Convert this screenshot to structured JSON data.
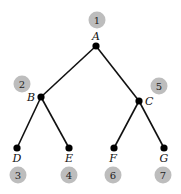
{
  "diagram": {
    "type": "binary-tree-traversal-order",
    "colors": {
      "edge": "#111111",
      "node": "#000000",
      "order_badge": "#bdbdbd",
      "order_text": "#222222"
    },
    "nodes": [
      {
        "id": "A",
        "label": "A",
        "x": 96,
        "y": 46,
        "label_x": 96,
        "label_y": 40,
        "label_anchor": "middle",
        "order": "1",
        "order_x": 97,
        "order_y": 20
      },
      {
        "id": "B",
        "label": "B",
        "x": 41,
        "y": 97,
        "label_x": 35,
        "label_y": 101,
        "label_anchor": "end",
        "order": "2",
        "order_x": 22,
        "order_y": 84
      },
      {
        "id": "C",
        "label": "C",
        "x": 139,
        "y": 101,
        "label_x": 145,
        "label_y": 105,
        "label_anchor": "start",
        "order": "5",
        "order_x": 159,
        "order_y": 86
      },
      {
        "id": "D",
        "label": "D",
        "x": 17,
        "y": 148,
        "label_x": 17,
        "label_y": 162,
        "label_anchor": "middle",
        "order": "3",
        "order_x": 18,
        "order_y": 175
      },
      {
        "id": "E",
        "label": "E",
        "x": 69,
        "y": 148,
        "label_x": 69,
        "label_y": 162,
        "label_anchor": "middle",
        "order": "4",
        "order_x": 69,
        "order_y": 175
      },
      {
        "id": "F",
        "label": "F",
        "x": 114,
        "y": 148,
        "label_x": 113,
        "label_y": 162,
        "label_anchor": "middle",
        "order": "6",
        "order_x": 113,
        "order_y": 175
      },
      {
        "id": "G",
        "label": "G",
        "x": 164,
        "y": 148,
        "label_x": 164,
        "label_y": 162,
        "label_anchor": "middle",
        "order": "7",
        "order_x": 163,
        "order_y": 175
      }
    ],
    "edges": [
      {
        "from": "A",
        "to": "B"
      },
      {
        "from": "A",
        "to": "C"
      },
      {
        "from": "B",
        "to": "D"
      },
      {
        "from": "B",
        "to": "E"
      },
      {
        "from": "C",
        "to": "F"
      },
      {
        "from": "C",
        "to": "G"
      }
    ]
  }
}
